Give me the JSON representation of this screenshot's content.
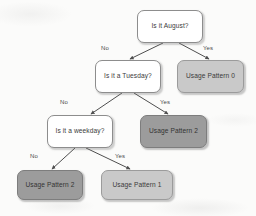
{
  "diagram": {
    "type": "decision-tree",
    "title": "",
    "nodes": [
      {
        "id": "root",
        "label": "Is it August?",
        "kind": "decision",
        "x": 137,
        "y": 10,
        "w": 66,
        "h": 33,
        "font": 6.6
      },
      {
        "id": "tuesday",
        "label": "Is it a Tuesday?",
        "kind": "decision",
        "x": 95,
        "y": 60,
        "w": 66,
        "h": 33,
        "font": 6.6
      },
      {
        "id": "pattern0",
        "label": "Usage Pattern 0",
        "kind": "leaf-light",
        "x": 177,
        "y": 60,
        "w": 67,
        "h": 33,
        "font": 6.6
      },
      {
        "id": "weekday",
        "label": "Is it a weekday?",
        "kind": "decision",
        "x": 47,
        "y": 115,
        "w": 66,
        "h": 33,
        "font": 6.6
      },
      {
        "id": "pattern2a",
        "label": "Usage Pattern 2",
        "kind": "leaf-dark",
        "x": 140,
        "y": 115,
        "w": 67,
        "h": 33,
        "font": 6.6
      },
      {
        "id": "pattern2b",
        "label": "Usage Pattern 2",
        "kind": "leaf-dark",
        "x": 17,
        "y": 170,
        "w": 66,
        "h": 30,
        "font": 6.6
      },
      {
        "id": "pattern1",
        "label": "Usage Pattern 1",
        "kind": "leaf-light",
        "x": 101,
        "y": 170,
        "w": 72,
        "h": 30,
        "font": 6.6
      }
    ],
    "edges": [
      {
        "from": "root",
        "to": "tuesday",
        "label": "No",
        "label_x": 101,
        "label_y": 45,
        "x1": 163,
        "y1": 43,
        "x2": 130,
        "y2": 59
      },
      {
        "from": "root",
        "to": "pattern0",
        "label": "Yes",
        "label_x": 203,
        "label_y": 45,
        "x1": 179,
        "y1": 43,
        "x2": 209,
        "y2": 59
      },
      {
        "from": "tuesday",
        "to": "weekday",
        "label": "No",
        "label_x": 60,
        "label_y": 99,
        "x1": 122,
        "y1": 93,
        "x2": 91,
        "y2": 114
      },
      {
        "from": "tuesday",
        "to": "pattern2a",
        "label": "Yes",
        "label_x": 160,
        "label_y": 99,
        "x1": 134,
        "y1": 93,
        "x2": 168,
        "y2": 114
      },
      {
        "from": "weekday",
        "to": "pattern2b",
        "label": "No",
        "label_x": 30,
        "label_y": 153,
        "x1": 75,
        "y1": 148,
        "x2": 52,
        "y2": 169
      },
      {
        "from": "weekday",
        "to": "pattern1",
        "label": "Yes",
        "label_x": 115,
        "label_y": 153,
        "x1": 86,
        "y1": 148,
        "x2": 130,
        "y2": 169
      }
    ],
    "colors": {
      "background": "#fbfbfa",
      "decision_fill": "#ffffff",
      "decision_stroke": "#8d8d8d",
      "leaf_light_fill": "#c9c9c9",
      "leaf_dark_fill": "#9c9c9c",
      "edge_stroke": "#4f4f4f",
      "text": "#3b3b3b"
    }
  }
}
